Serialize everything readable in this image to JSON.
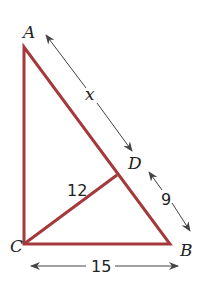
{
  "diagram": {
    "type": "right-triangle-altitude",
    "colors": {
      "triangle": "#a5383a",
      "arrows": "#444444",
      "text": "#222222"
    },
    "vertices": {
      "A": {
        "label": "A",
        "x": 24,
        "y": 47
      },
      "C": {
        "label": "C",
        "x": 24,
        "y": 244
      },
      "B": {
        "label": "B",
        "x": 170,
        "y": 244
      },
      "D": {
        "label": "D",
        "x": 117,
        "y": 175
      }
    },
    "segments": [
      {
        "name": "AC",
        "from": "A",
        "to": "C"
      },
      {
        "name": "CB",
        "from": "C",
        "to": "B"
      },
      {
        "name": "AB",
        "from": "A",
        "to": "B"
      },
      {
        "name": "CD",
        "from": "C",
        "to": "D",
        "note": "altitude"
      }
    ],
    "measures": {
      "AD": "x",
      "DB": "9",
      "CD": "12",
      "CB": "15"
    }
  }
}
